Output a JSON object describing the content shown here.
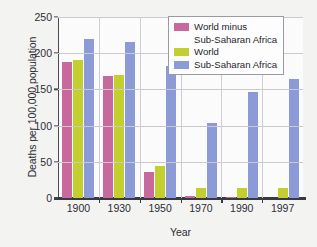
{
  "chart_data": {
    "type": "bar",
    "title": "",
    "xlabel": "Year",
    "ylabel": "Deaths per 100,000 population",
    "categories": [
      "1900",
      "1930",
      "1950",
      "1970",
      "1990",
      "1997"
    ],
    "ylim": [
      0,
      250
    ],
    "yticks": [
      0,
      50,
      100,
      150,
      200,
      250
    ],
    "ytick_labels": [
      "0",
      "50",
      "100",
      "150",
      "200",
      "250"
    ],
    "grid": "horizontal",
    "legend_position": "top-right",
    "series": [
      {
        "name": "World minus Sub-Saharan Africa",
        "color": "#c8699e",
        "values": [
          188,
          169,
          36,
          3,
          1,
          0
        ]
      },
      {
        "name": "World",
        "color": "#c2cf2f",
        "values": [
          191,
          170,
          44,
          14,
          14,
          14
        ]
      },
      {
        "name": "Sub-Saharan Africa",
        "color": "#8c9ad7",
        "values": [
          220,
          215,
          183,
          104,
          146,
          165
        ]
      }
    ]
  },
  "legend": {
    "entries": [
      {
        "label_line1": "World minus",
        "label_line2": "Sub-Saharan Africa",
        "color": "#c8699e"
      },
      {
        "label_line1": "World",
        "label_line2": "",
        "color": "#c2cf2f"
      },
      {
        "label_line1": "Sub-Saharan Africa",
        "label_line2": "",
        "color": "#8c9ad7"
      }
    ]
  }
}
